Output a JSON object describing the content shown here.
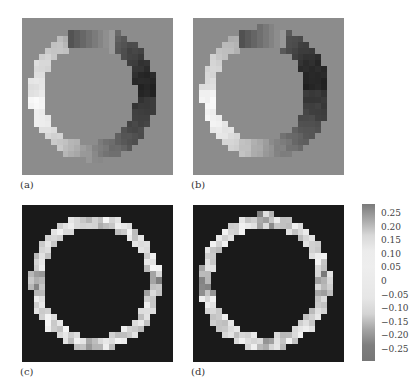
{
  "panels": [
    {
      "id": "a",
      "label": "(a)",
      "x": 22,
      "y": 18,
      "background": "#8c8c8c",
      "mode": "phase",
      "rotation": 0,
      "cx": 12.2,
      "cy": 12.6,
      "rOut": 11.0,
      "rIn": 8.1,
      "offsetX": -0.6
    },
    {
      "id": "b",
      "label": "(b)",
      "x": 193,
      "y": 18,
      "background": "#8c8c8c",
      "mode": "phase",
      "rotation": 0.15,
      "cx": 12.4,
      "cy": 12.4,
      "rOut": 11.0,
      "rIn": 7.9,
      "offsetX": -0.8
    },
    {
      "id": "c",
      "label": "(c)",
      "x": 22,
      "y": 205,
      "background": "#1a1a1a",
      "mode": "magnitude",
      "cx": 12.6,
      "cy": 12.8,
      "rOut": 11.2,
      "rIn": 9.0,
      "offsetX": 0
    },
    {
      "id": "d",
      "label": "(d)",
      "x": 193,
      "y": 205,
      "background": "#1a1a1a",
      "mode": "magnitude",
      "cx": 12.4,
      "cy": 12.7,
      "rOut": 11.3,
      "rIn": 9.0,
      "offsetX": 0
    }
  ],
  "grid_size": 26,
  "colorbar": {
    "ticks": [
      "0.25",
      "0.20",
      "0.15",
      "0.10",
      "0.05",
      "0",
      "−0.05",
      "−0.10",
      "−0.15",
      "−0.20",
      "−0.25"
    ],
    "stops": [
      "#7a7a7a",
      "#a8a8a8",
      "#d8d8d8",
      "#ececec",
      "#eeeeee",
      "#eaeaea",
      "#e6e6e6",
      "#d4d4d4",
      "#a4a4a4",
      "#7e7e7e",
      "#767676"
    ]
  },
  "chart_data": {
    "type": "heatmap",
    "title": "",
    "panels": [
      {
        "label": "(a)",
        "description": "Crescent-shaped ring map on gray background; bright on left, dark on right, uniform gray interior"
      },
      {
        "label": "(b)",
        "description": "Similar crescent ring map; bright on left, dark on right"
      },
      {
        "label": "(c)",
        "description": "Bright annular ring on dark background with dark interior"
      },
      {
        "label": "(d)",
        "description": "Bright annular ring on dark background with dark interior"
      }
    ],
    "colorbar": {
      "min": -0.25,
      "max": 0.25,
      "ticks": [
        0.25,
        0.2,
        0.15,
        0.1,
        0.05,
        0,
        -0.05,
        -0.1,
        -0.15,
        -0.2,
        -0.25
      ]
    },
    "xlabel": "",
    "ylabel": ""
  }
}
